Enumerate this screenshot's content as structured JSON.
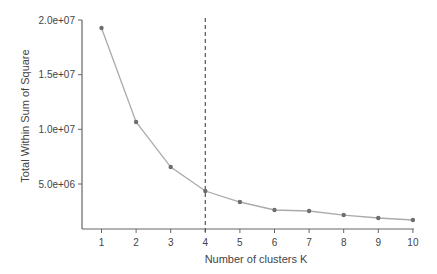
{
  "chart_data": {
    "type": "line",
    "title": "",
    "xlabel": "Number of clusters K",
    "ylabel": "Total Within Sum of Square",
    "x": [
      1,
      2,
      3,
      4,
      5,
      6,
      7,
      8,
      9,
      10
    ],
    "series": [
      {
        "name": "Total Within Sum of Square",
        "values": [
          19270000,
          10670000,
          6550000,
          4360000,
          3350000,
          2620000,
          2530000,
          2160000,
          1890000,
          1710000
        ]
      }
    ],
    "xticks": [
      "1",
      "2",
      "3",
      "4",
      "5",
      "6",
      "7",
      "8",
      "9",
      "10"
    ],
    "yticks": [
      {
        "value": 5000000,
        "label": "5.0e+06"
      },
      {
        "value": 10000000,
        "label": "1.0e+07"
      },
      {
        "value": 15000000,
        "label": "1.5e+07"
      },
      {
        "value": 20000000,
        "label": "2.0e+07"
      }
    ],
    "annotations": [
      {
        "type": "vline",
        "x": 4,
        "style": "dashed"
      }
    ],
    "grid": false,
    "legend": "none",
    "colors": {
      "line": "#aaaaaa",
      "points": "#6e6e6e",
      "axis": "#666666",
      "vline": "#555555",
      "text": "#444444"
    }
  }
}
